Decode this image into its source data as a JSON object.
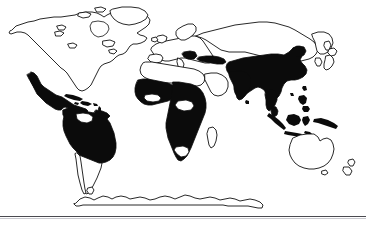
{
  "figure": {
    "kind": "world-map-thematic",
    "title": "",
    "caption": "",
    "projection": "robinson-like-world-map"
  },
  "legend": {
    "present": false,
    "entries": [
      {
        "key": "shaded",
        "label": "Shaded region",
        "color": "#0b0b0b"
      },
      {
        "key": "unshaded",
        "label": "Unshaded region",
        "color": "#ffffff"
      }
    ]
  },
  "colors": {
    "background": "#ffffff",
    "shaded_fill": "#0b0b0b",
    "unshaded_fill": "#ffffff",
    "coastline_stroke": "#111111",
    "footer_rule": "#4a4a50",
    "footer_rule_highlight": "#c9c9cf"
  },
  "map_regions": {
    "shaded": [
      "Mexico",
      "Central America",
      "Caribbean",
      "Colombia",
      "Venezuela",
      "Guyanas",
      "Brazil",
      "Peru",
      "Bolivia",
      "Paraguay",
      "Ecuador",
      "Balkans",
      "Turkey",
      "Sub-Saharan West Africa",
      "Central Africa",
      "East Africa",
      "Southern Africa",
      "Arabian Peninsula edge",
      "India",
      "Pakistan",
      "Bangladesh",
      "China",
      "Mongolia border",
      "Indochina",
      "Thailand",
      "Myanmar",
      "Indonesia",
      "Philippines",
      "Papua New Guinea"
    ],
    "unshaded": [
      "Canada",
      "United States",
      "Greenland",
      "Argentina",
      "Chile",
      "Uruguay",
      "Western Europe",
      "Scandinavia",
      "Russia",
      "North Africa",
      "Madagascar",
      "Japan",
      "Korea",
      "Australia",
      "New Zealand",
      "Antarctica"
    ]
  },
  "footer": {
    "rule_visible": true,
    "text": ""
  }
}
